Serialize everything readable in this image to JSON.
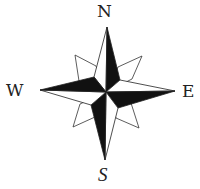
{
  "diagram": {
    "type": "compass-rose",
    "labels": {
      "north": "N",
      "south": "S",
      "west": "W",
      "east": "E"
    },
    "colors": {
      "fill_dark": "#111111",
      "fill_light": "#ffffff",
      "stroke": "#333333",
      "text": "#222222",
      "background": "#ffffff"
    },
    "points": {
      "center": [
        106,
        92
      ],
      "north_tip": [
        107,
        27
      ],
      "south_tip": [
        105,
        160
      ],
      "west_tip": [
        40,
        90
      ],
      "east_tip": [
        175,
        91
      ],
      "nw_tip": [
        75,
        55
      ],
      "ne_tip": [
        142,
        56
      ],
      "sw_tip": [
        73,
        127
      ],
      "se_tip": [
        139,
        128
      ]
    }
  }
}
